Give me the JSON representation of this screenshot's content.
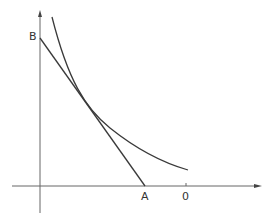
{
  "diagram": {
    "type": "economics-tangency",
    "labels": {
      "y_intercept": "B",
      "x_intercept": "A",
      "x_marker": "0"
    },
    "colors": {
      "line": "#3a3a3a",
      "axis": "#555555",
      "background": "#ffffff"
    }
  }
}
